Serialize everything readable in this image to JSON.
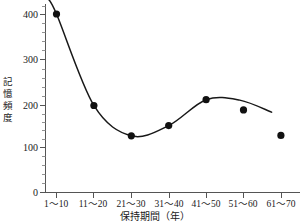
{
  "chart_data": {
    "type": "scatter",
    "title": "",
    "xlabel": "保持期間（年）",
    "ylabel": "記憶頻度",
    "categories": [
      "1〜10",
      "11〜20",
      "21〜30",
      "31〜40",
      "41〜50",
      "51〜60",
      "61〜70"
    ],
    "values": [
      400,
      195,
      127,
      150,
      208,
      185,
      128
    ],
    "series": [
      {
        "name": "記憶頻度",
        "values": [
          400,
          195,
          127,
          150,
          208,
          185,
          128
        ]
      }
    ],
    "y_ticks": [
      "0",
      "100",
      "200",
      "300",
      "400"
    ],
    "y_tick_values": [
      0,
      100,
      200,
      300,
      400
    ],
    "ylim": [
      0,
      430
    ],
    "xlim": [
      0,
      8
    ],
    "grid": false,
    "legend": false,
    "legend_position": "none",
    "has_fit_curve": true,
    "fit_curve_note": "smoothed polynomial trend line through points 1-6",
    "marker": "filled-circle",
    "marker_color": "#111111",
    "curve_color": "#181818",
    "axis_color": "#555555",
    "background": "#ffffff"
  },
  "axis": {
    "y_title": "記憶頻度",
    "y_title_chars": [
      "記",
      "憶",
      "頻",
      "度"
    ],
    "x_title": "保持期間（年）"
  }
}
